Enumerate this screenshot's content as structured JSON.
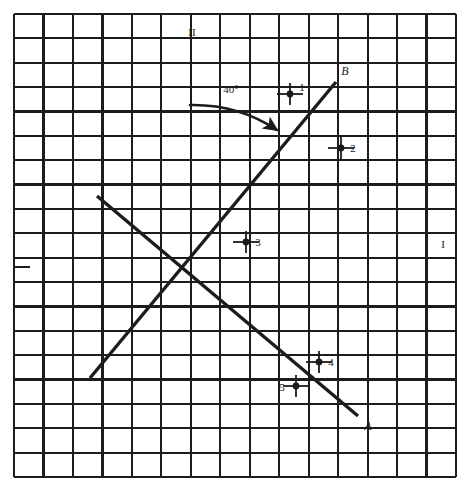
{
  "figure": {
    "kind": "geometry-grid-diagram",
    "background_color": "#ffffff",
    "ink_color": "#1c1c1c",
    "grid": {
      "left": 14,
      "top": 14,
      "right": 456,
      "bottom": 477,
      "columns": 15,
      "rows": 19,
      "cell_width": 29.5,
      "cell_height": 24.4,
      "minor_line_width": 1.1,
      "major_line_width": 2.2,
      "border_width": 2.4,
      "major_every": 1
    },
    "axes": {
      "horizontal_tick_label": "I",
      "horizontal_tick_label_x": 443,
      "horizontal_tick_label_y": 248,
      "vertical_tick_label": "II",
      "vertical_tick_label_x": 192,
      "vertical_tick_label_y": 36,
      "origin_x": 178,
      "origin_y": 267,
      "left_dash_x1": 14,
      "left_dash_x2": 30,
      "left_dash_y": 267
    },
    "lines": [
      {
        "name": "line-A",
        "label": "A",
        "label_x": 368,
        "label_y": 430,
        "x1": 97,
        "y1": 196,
        "x2": 358,
        "y2": 416,
        "stroke_width": 3.4
      },
      {
        "name": "line-B",
        "label": "B",
        "label_x": 345,
        "label_y": 75,
        "x1": 90,
        "y1": 378,
        "x2": 336,
        "y2": 82,
        "stroke_width": 3.4
      }
    ],
    "angle_annotation": {
      "label": "40°",
      "label_x": 231,
      "label_y": 93,
      "arrow_start_x": 190,
      "arrow_start_y": 105,
      "arrow_ctrl_x": 238,
      "arrow_ctrl_y": 104,
      "arrow_end_x": 277,
      "arrow_end_y": 130,
      "stroke_width": 2.6
    },
    "points": [
      {
        "label": "1",
        "x": 290,
        "y": 94,
        "label_x": 302,
        "label_y": 91,
        "dot_r": 3.4,
        "tick_h": 26,
        "tick_v": 22
      },
      {
        "label": "2",
        "x": 341,
        "y": 148,
        "label_x": 353,
        "label_y": 152,
        "dot_r": 3.4,
        "tick_h": 26,
        "tick_v": 22
      },
      {
        "label": "3",
        "x": 246,
        "y": 242,
        "label_x": 258,
        "label_y": 246,
        "dot_r": 3.4,
        "tick_h": 26,
        "tick_v": 22
      },
      {
        "label": "4",
        "x": 319,
        "y": 362,
        "label_x": 331,
        "label_y": 366,
        "dot_r": 3.4,
        "tick_h": 26,
        "tick_v": 22
      },
      {
        "label": "5",
        "x": 296,
        "y": 386,
        "label_x": 282,
        "label_y": 391,
        "dot_r": 3.4,
        "tick_h": 26,
        "tick_v": 22
      }
    ],
    "text_sizes": {
      "point_label": 11,
      "line_label": 12,
      "axis_label": 11,
      "angle_label": 11
    }
  }
}
